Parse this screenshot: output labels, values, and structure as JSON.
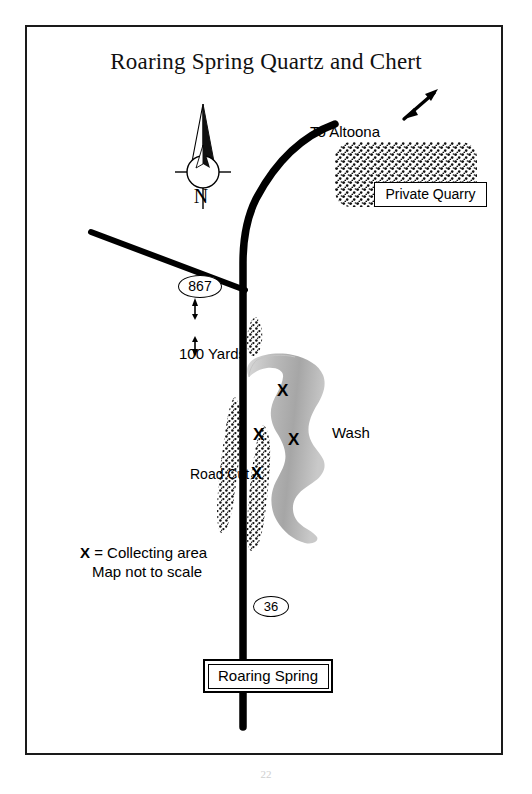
{
  "document": {
    "title": "Roaring Spring Quartz and Chert",
    "page_number": "22"
  },
  "map": {
    "title": "Roaring Spring Quartz and Chert",
    "compass": {
      "north_label": "N",
      "icon": "compass-rose-north-icon"
    },
    "direction_note": {
      "label": "To Altoona",
      "arrow_icon": "arrow-up-right-icon",
      "arrow_direction": "northeast"
    },
    "features": [
      {
        "name": "private-quarry",
        "label": "Private Quarry",
        "fill": "stipple",
        "shape": "rounded-rectangle"
      },
      {
        "name": "wash",
        "label": "Wash",
        "fill": "gray-gradient",
        "shape": "winding-ribbon"
      },
      {
        "name": "road-cut",
        "label": "Road Cut",
        "fill": "stipple",
        "shape": "elongated-strip"
      },
      {
        "name": "town",
        "label": "Roaring Spring",
        "fill": "white",
        "shape": "double-bordered-box"
      }
    ],
    "routes": [
      {
        "name": "route-867",
        "shield_label": "867",
        "orientation": "diagonal-northwest-to-southeast"
      },
      {
        "name": "route-36",
        "shield_label": "36",
        "orientation": "vertical-main-road"
      }
    ],
    "scale_bar": {
      "label": "100 Yards",
      "arrow_icon": "double-headed-vertical-arrow-icon"
    },
    "collecting_areas": {
      "marker_glyph": "X",
      "count": 4,
      "positions": [
        {
          "id": "x-1",
          "x": 283,
          "y": 388,
          "near": "wash-upper"
        },
        {
          "id": "x-2",
          "x": 259,
          "y": 432,
          "near": "road-cut-east"
        },
        {
          "id": "x-3",
          "x": 294,
          "y": 437,
          "near": "wash-middle"
        },
        {
          "id": "x-4",
          "x": 257,
          "y": 471,
          "near": "road-cut-east-lower"
        }
      ]
    },
    "legend": {
      "marker": "X",
      "equals": " = Collecting area",
      "note": "Map not to scale"
    },
    "colors": {
      "ink": "#000000",
      "frame": "#1a1a1a",
      "paper": "#ffffff",
      "wash_gray_light": "#d8d8d8",
      "wash_gray_dark": "#9a9a9a",
      "stipple": "#111111"
    }
  }
}
